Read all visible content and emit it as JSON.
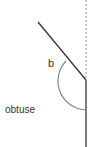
{
  "diagram": {
    "angle_label": "b",
    "angle_type_label": "obtuse",
    "colors": {
      "ray": "#333333",
      "arc": "#888888",
      "dashed_reference": "#999999",
      "text": "#333333"
    }
  }
}
